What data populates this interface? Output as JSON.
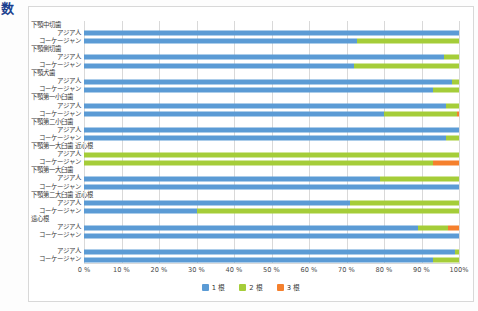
{
  "stray_glyph": "数",
  "chart_data": {
    "type": "bar",
    "orientation": "horizontal",
    "stacked": true,
    "normalized_percent": true,
    "title": "",
    "xlabel": "",
    "ylabel": "",
    "xlim": [
      0,
      100
    ],
    "grid": true,
    "legend_position": "bottom",
    "xtick_labels": [
      "0 %",
      "10 %",
      "20 %",
      "30 %",
      "40 %",
      "50 %",
      "60 %",
      "70 %",
      "80 %",
      "90 %",
      "100%"
    ],
    "xticks": [
      0,
      10,
      20,
      30,
      40,
      50,
      60,
      70,
      80,
      90,
      100
    ],
    "legend": [
      "1 根",
      "2 根",
      "3 根"
    ],
    "series_colors": [
      "#5b9bd5",
      "#a5cd39",
      "#f5802d"
    ],
    "groups": [
      {
        "group_label": "下顎中切歯",
        "rows": [
          {
            "label": "アジア人",
            "values": [
              100,
              0,
              0
            ]
          },
          {
            "label": "コーケージャン",
            "values": [
              72.8,
              27.2,
              0
            ]
          }
        ]
      },
      {
        "group_label": "下顎側切歯",
        "rows": [
          {
            "label": "アジア人",
            "values": [
              96.0,
              4.0,
              0
            ]
          },
          {
            "label": "コーケージャン",
            "values": [
              72.0,
              28.0,
              0
            ]
          }
        ]
      },
      {
        "group_label": "下顎犬歯",
        "rows": [
          {
            "label": "アジア人",
            "values": [
              98.0,
              2.0,
              0
            ]
          },
          {
            "label": "コーケージャン",
            "values": [
              93.0,
              7.0,
              0
            ]
          }
        ]
      },
      {
        "group_label": "下顎第一小臼歯",
        "rows": [
          {
            "label": "アジア人",
            "values": [
              96.5,
              3.5,
              0
            ]
          },
          {
            "label": "コーケージャン",
            "values": [
              80.0,
              19.5,
              0.5
            ]
          }
        ]
      },
      {
        "group_label": "下顎第二小臼歯",
        "rows": [
          {
            "label": "アジア人",
            "values": [
              100,
              0,
              0
            ]
          },
          {
            "label": "コーケージャン",
            "values": [
              96.5,
              3.5,
              0
            ]
          }
        ]
      },
      {
        "group_label": "下顎第一大臼歯 近心根",
        "rows": [
          {
            "label": "アジア人",
            "values": [
              0,
              100,
              0
            ]
          },
          {
            "label": "コーケージャン",
            "values": [
              0,
              93.0,
              7.0
            ]
          }
        ]
      },
      {
        "group_label": "下顎第一大臼歯",
        "rows": [
          {
            "label": "アジア人",
            "values": [
              79.0,
              21.0,
              0
            ]
          },
          {
            "label": "コーケージャン",
            "values": [
              100,
              0,
              0
            ]
          }
        ]
      },
      {
        "group_label": "下顎第二大臼歯 近心根",
        "rows": [
          {
            "label": "アジア人",
            "values": [
              71.0,
              29.0,
              0
            ]
          },
          {
            "label": "コーケージャン",
            "values": [
              30.0,
              70.0,
              0
            ]
          }
        ]
      },
      {
        "group_label": "遠心根",
        "rows": [
          {
            "label": "アジア人",
            "values": [
              89.0,
              8.0,
              3.0
            ]
          },
          {
            "label": "コーケージャン",
            "values": [
              100,
              0,
              0
            ]
          }
        ]
      },
      {
        "group_label": "",
        "rows": [
          {
            "label": "アジア人",
            "values": [
              99.0,
              1.0,
              0
            ]
          },
          {
            "label": "コーケージャン",
            "values": [
              93.0,
              7.0,
              0
            ]
          }
        ]
      }
    ]
  }
}
